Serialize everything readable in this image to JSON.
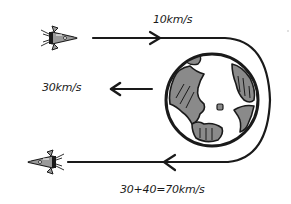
{
  "diagram": {
    "labels": {
      "incoming_speed": "10km/s",
      "planet_speed": "30km/s",
      "outgoing_speed": "30+40=70km/s"
    },
    "elements": {
      "incoming_spacecraft": {
        "direction": "right",
        "icon": "rocket-icon"
      },
      "outgoing_spacecraft": {
        "direction": "left",
        "icon": "rocket-icon"
      },
      "planet": {
        "name": "Earth",
        "icon": "globe-icon"
      },
      "trajectory": {
        "shape": "U-turn around planet",
        "incoming_arrow": "right",
        "outgoing_arrow": "left"
      },
      "planet_motion_arrow": {
        "direction": "left"
      }
    },
    "colors": {
      "ink": "#1a1a1a",
      "land": "#8a8a8a",
      "rocket_body": "#9a9a9a",
      "background": "#ffffff"
    }
  }
}
